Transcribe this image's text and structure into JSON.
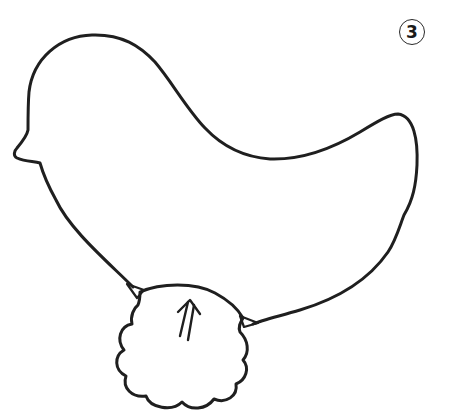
{
  "figure": {
    "step_number": "3",
    "arrow_glyph": "⇈",
    "stroke_color": "#1f1f1f",
    "background_color": "#ffffff"
  }
}
